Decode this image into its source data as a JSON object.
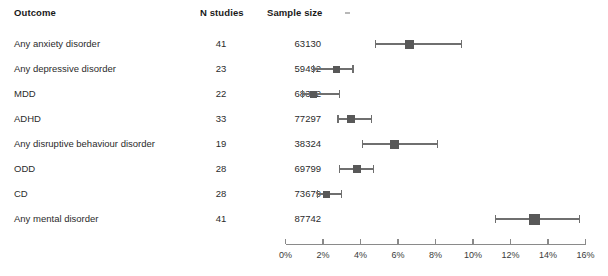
{
  "table": {
    "headers": {
      "outcome": "Outcome",
      "n_studies": "N studies",
      "sample_size": "Sample size"
    },
    "rows": [
      {
        "outcome": "Any anxiety disorder",
        "n_studies": "41",
        "sample_size": "63130"
      },
      {
        "outcome": "Any depressive disorder",
        "n_studies": "23",
        "sample_size": "59492"
      },
      {
        "outcome": "MDD",
        "n_studies": "22",
        "sample_size": "68382"
      },
      {
        "outcome": "ADHD",
        "n_studies": "33",
        "sample_size": "77297"
      },
      {
        "outcome": "Any disruptive  behaviour disorder",
        "n_studies": "19",
        "sample_size": "38324"
      },
      {
        "outcome": "ODD",
        "n_studies": "28",
        "sample_size": "69799"
      },
      {
        "outcome": "CD",
        "n_studies": "28",
        "sample_size": "73679"
      },
      {
        "outcome": "Any mental disorder",
        "n_studies": "41",
        "sample_size": "87742"
      }
    ]
  },
  "chart_data": {
    "type": "forest",
    "title": "",
    "xlabel": "",
    "ylabel": "",
    "xlim": [
      0,
      16
    ],
    "x_unit": "%",
    "grid": false,
    "legend": "none",
    "marker_color": "#585858",
    "line_color": "#6f6f6f",
    "axis_color": "#8a8a8a",
    "tick_labels": [
      "0%",
      "2%",
      "4%",
      "6%",
      "8%",
      "10%",
      "12%",
      "14%",
      "16%"
    ],
    "tick_values": [
      0,
      2,
      4,
      6,
      8,
      10,
      12,
      14,
      16
    ],
    "categories": [
      "Any anxiety disorder",
      "Any depressive disorder",
      "MDD",
      "ADHD",
      "Any disruptive  behaviour disorder",
      "ODD",
      "CD",
      "Any mental disorder"
    ],
    "points": [
      {
        "label": "Any anxiety disorder",
        "estimate": 6.6,
        "ci_low": 4.8,
        "ci_high": 9.4,
        "marker_size": 9
      },
      {
        "label": "Any depressive disorder",
        "estimate": 2.7,
        "ci_low": 1.5,
        "ci_high": 3.6,
        "marker_size": 7
      },
      {
        "label": "MDD",
        "estimate": 1.5,
        "ci_low": 0.9,
        "ci_high": 2.9,
        "marker_size": 7
      },
      {
        "label": "ADHD",
        "estimate": 3.5,
        "ci_low": 2.8,
        "ci_high": 4.6,
        "marker_size": 8
      },
      {
        "label": "Any disruptive  behaviour disorder",
        "estimate": 5.8,
        "ci_low": 4.1,
        "ci_high": 8.1,
        "marker_size": 9
      },
      {
        "label": "ODD",
        "estimate": 3.8,
        "ci_low": 2.9,
        "ci_high": 4.7,
        "marker_size": 8
      },
      {
        "label": "CD",
        "estimate": 2.2,
        "ci_low": 1.7,
        "ci_high": 3.0,
        "marker_size": 7
      },
      {
        "label": "Any mental disorder",
        "estimate": 13.3,
        "ci_low": 11.2,
        "ci_high": 15.7,
        "marker_size": 11
      }
    ]
  }
}
